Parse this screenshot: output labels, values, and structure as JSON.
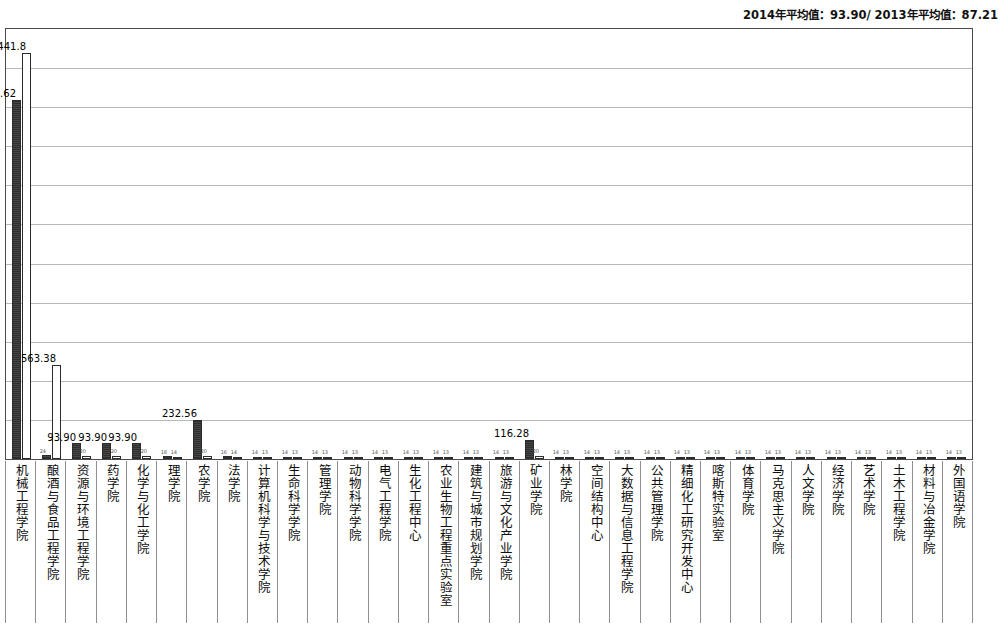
{
  "header": {
    "note": "2014年平均值：93.90/ 2013年平均值：87.21"
  },
  "colors": {
    "series_2013": "#3a3a3a",
    "series_2014": "#ffffff",
    "bar_outline": "#2b2b2b",
    "gridline": "#b9b9b9",
    "frame": "#4a4a4a",
    "text": "#0d0d0d"
  },
  "chart_data": {
    "type": "bar",
    "title": "",
    "subtitle": "",
    "xlabel": "",
    "ylabel": "",
    "ylim": [
      0,
      2600
    ],
    "grid": true,
    "gridline_count": 10,
    "legend_position": "none",
    "axis_tick_labels": [],
    "annotations": [
      "2014年平均值：93.90/ 2013年平均值：87.21"
    ],
    "categories": [
      "机械工程学院",
      "酿酒与食品工程学院",
      "资源与环境工程学院",
      "药学院",
      "化学与化工学院",
      "理学院",
      "农学院",
      "法学院",
      "计算机科学与技术学院",
      "生命科学学院",
      "管理学院",
      "动物科学学院",
      "电气工程学院",
      "生化工程中心",
      "农业生物工程重点实验室",
      "建筑与城市规划学院",
      "旅游与文化产业学院",
      "矿业学院",
      "林学院",
      "空间结构中心",
      "大数据与信息工程学院",
      "公共管理学院",
      "精细化工研究开发中心",
      "喀斯特实验室",
      "体育学院",
      "马克思主义学院",
      "人文学院",
      "经济学院",
      "艺术学院",
      "土木工程学院",
      "材料与冶金学院",
      "外国语学院"
    ],
    "series": [
      {
        "name": "2013",
        "values": [
          2159.62,
          24.0,
          93.9,
          93.9,
          93.9,
          18.0,
          232.56,
          16.0,
          14.0,
          14.0,
          14.0,
          14.0,
          14.0,
          14.0,
          14.0,
          14.0,
          14.0,
          116.28,
          14.0,
          14.0,
          14.0,
          14.0,
          14.0,
          14.0,
          14.0,
          14.0,
          14.0,
          14.0,
          14.0,
          14.0,
          14.0,
          14.0
        ],
        "labels": [
          "2159.62",
          "",
          "93.90",
          "93.90",
          "93.90",
          "",
          "232.56",
          "",
          "",
          "",
          "",
          "",
          "",
          "",
          "",
          "",
          "",
          "116.28",
          "",
          "",
          "",
          "",
          "",
          "",
          "",
          "",
          "",
          "",
          "",
          "",
          "",
          ""
        ]
      },
      {
        "name": "2014",
        "values": [
          2441.8,
          563.38,
          20.0,
          20.0,
          20.0,
          14.0,
          20.0,
          14.0,
          13.0,
          13.0,
          13.0,
          13.0,
          13.0,
          13.0,
          13.0,
          13.0,
          13.0,
          20.0,
          13.0,
          13.0,
          13.0,
          13.0,
          13.0,
          13.0,
          13.0,
          13.0,
          13.0,
          13.0,
          13.0,
          13.0,
          13.0,
          13.0
        ],
        "labels": [
          "2441.8",
          "563.38",
          "",
          "",
          "",
          "",
          "",
          "",
          "",
          "",
          "",
          "",
          "",
          "",
          "",
          "",
          "",
          "",
          "",
          "",
          "",
          "",
          "",
          "",
          "",
          "",
          "",
          "",
          "",
          "",
          "",
          ""
        ]
      }
    ]
  }
}
